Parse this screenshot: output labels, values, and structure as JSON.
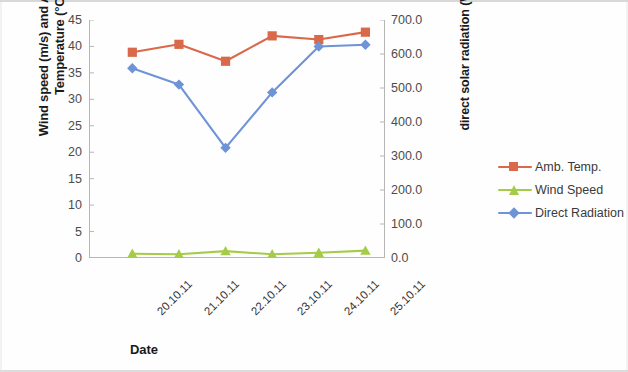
{
  "chart_data": {
    "type": "line",
    "title": "",
    "xlabel": "Date",
    "categories": [
      "20.10.11",
      "21.10.11",
      "22.10.11",
      "23.10.11",
      "24.10.11",
      "25.10.11"
    ],
    "grid": false,
    "legend_position": "right",
    "axes": {
      "left": {
        "label": "Wind speed (m/s) and Ambient Temperature (°C)",
        "ylim": [
          0,
          45
        ],
        "tick_step": 5,
        "ticks": [
          "45",
          "40",
          "35",
          "30",
          "25",
          "20",
          "15",
          "10",
          "5",
          "0"
        ]
      },
      "right": {
        "label": "direct solar radiation  (W/m²)",
        "ylim": [
          0,
          700
        ],
        "tick_step": 100,
        "ticks": [
          "700.0",
          "600.0",
          "500.0",
          "400.0",
          "300.0",
          "200.0",
          "100.0",
          "0.0"
        ]
      }
    },
    "series": [
      {
        "name": "Amb. Temp.",
        "axis": "left",
        "unit": "°C",
        "color": "#d9694a",
        "marker": "square",
        "values": [
          38.9,
          40.4,
          37.2,
          42.0,
          41.3,
          42.7
        ]
      },
      {
        "name": "Wind Speed",
        "axis": "left",
        "unit": "m/s",
        "color": "#a5cc48",
        "marker": "triangle",
        "values": [
          0.8,
          0.7,
          1.3,
          0.7,
          1.0,
          1.4
        ]
      },
      {
        "name": "Direct Radiation",
        "axis": "right",
        "unit": "W/m²",
        "color": "#6e93d6",
        "marker": "diamond",
        "values": [
          558,
          510,
          324,
          487,
          622,
          627
        ]
      }
    ]
  },
  "legend": {
    "items": [
      {
        "label": "Amb. Temp."
      },
      {
        "label": "Wind Speed"
      },
      {
        "label": "Direct Radiation"
      }
    ]
  },
  "axis_titles": {
    "left": "Wind speed (m/s) and Ambient Temperature (°C)",
    "right": "direct solar radiation  (W/m²)",
    "bottom": "Date"
  }
}
